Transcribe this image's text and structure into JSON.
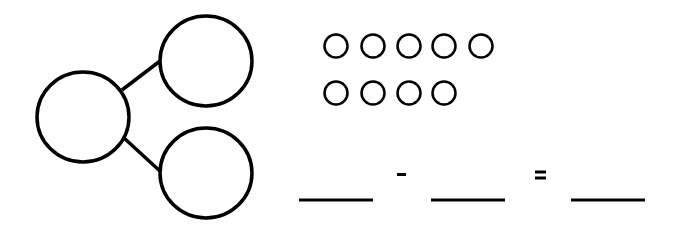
{
  "number_bond": {
    "whole": "",
    "part_top": "",
    "part_bottom": ""
  },
  "counters": {
    "row1_count": 5,
    "row2_count": 4,
    "total": 9
  },
  "equation": {
    "blank1": "",
    "operator": "-",
    "blank2": "",
    "equals": "=",
    "blank3": ""
  },
  "colors": {
    "stroke": "#000000",
    "background": "#ffffff"
  }
}
